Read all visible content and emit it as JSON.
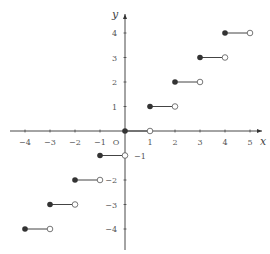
{
  "chart_data": {
    "type": "line",
    "title": "",
    "function": "y = floor(x)",
    "xlabel": "x",
    "ylabel": "y",
    "origin_label": "O",
    "xlim": [
      -4.5,
      5.5
    ],
    "ylim": [
      -4.8,
      5
    ],
    "grid": false,
    "x_ticks": [
      -4,
      -3,
      -2,
      -1,
      1,
      2,
      3,
      4,
      5
    ],
    "y_ticks": [
      -4,
      -3,
      -2,
      -1,
      1,
      2,
      3,
      4
    ],
    "x_tick_labels": [
      "−4",
      "−3",
      "−2",
      "−1",
      "1",
      "2",
      "3",
      "4",
      "5"
    ],
    "y_tick_labels": [
      "−4",
      "−3",
      "−2",
      "−1",
      "1",
      "2",
      "3",
      "4"
    ],
    "segments": [
      {
        "x_start": -4,
        "x_end": -3,
        "y": -4,
        "start": "closed",
        "end": "open"
      },
      {
        "x_start": -3,
        "x_end": -2,
        "y": -3,
        "start": "closed",
        "end": "open"
      },
      {
        "x_start": -2,
        "x_end": -1,
        "y": -2,
        "start": "closed",
        "end": "open"
      },
      {
        "x_start": -1,
        "x_end": 0,
        "y": -1,
        "start": "closed",
        "end": "open"
      },
      {
        "x_start": 0,
        "x_end": 1,
        "y": 0,
        "start": "closed",
        "end": "open"
      },
      {
        "x_start": 1,
        "x_end": 2,
        "y": 1,
        "start": "closed",
        "end": "open"
      },
      {
        "x_start": 2,
        "x_end": 3,
        "y": 2,
        "start": "closed",
        "end": "open"
      },
      {
        "x_start": 3,
        "x_end": 4,
        "y": 3,
        "start": "closed",
        "end": "open"
      },
      {
        "x_start": 4,
        "x_end": 5,
        "y": 4,
        "start": "closed",
        "end": "open"
      }
    ],
    "colors": {
      "axis": "#333333",
      "segment": "#444444",
      "closed_dot": "#333333",
      "open_dot_fill": "#ffffff",
      "open_dot_stroke": "#555555"
    }
  },
  "layout": {
    "origin_px": [
      125,
      131
    ],
    "unit_x_px": 25,
    "unit_y_px": 24.5
  }
}
